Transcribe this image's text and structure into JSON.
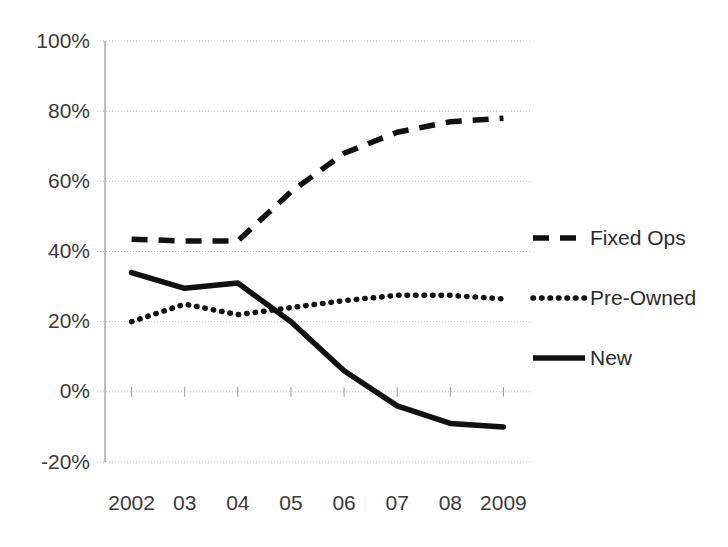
{
  "chart_data": {
    "type": "line",
    "title": "",
    "xlabel": "",
    "ylabel": "",
    "categories": [
      "2002",
      "03",
      "04",
      "05",
      "06",
      "07",
      "08",
      "2009"
    ],
    "ylim": [
      -20,
      100
    ],
    "ytick_labels": [
      "100%",
      "80%",
      "60%",
      "40%",
      "20%",
      "0%",
      "-20%"
    ],
    "ytick_values": [
      100,
      80,
      60,
      40,
      20,
      0,
      -20
    ],
    "grid": true,
    "legend_position": "right",
    "units": "percent",
    "series": [
      {
        "name": "Fixed Ops",
        "style": "dashed",
        "color": "#111111",
        "values": [
          43.5,
          43.0,
          43.0,
          57.0,
          68.0,
          74.0,
          77.0,
          78.0
        ]
      },
      {
        "name": "Pre-Owned",
        "style": "dotted",
        "color": "#111111",
        "values": [
          20.0,
          25.0,
          22.0,
          24.0,
          26.0,
          27.5,
          27.5,
          26.5
        ]
      },
      {
        "name": "New",
        "style": "solid",
        "color": "#111111",
        "values": [
          34.0,
          29.5,
          31.0,
          20.0,
          6.0,
          -4.0,
          -9.0,
          -10.0
        ]
      }
    ]
  },
  "axes": {
    "y_ticks": [
      {
        "label": "100%"
      },
      {
        "label": "80%"
      },
      {
        "label": "60%"
      },
      {
        "label": "40%"
      },
      {
        "label": "20%"
      },
      {
        "label": "0%"
      },
      {
        "label": "-20%"
      }
    ],
    "x_ticks": [
      {
        "label": "2002"
      },
      {
        "label": "03"
      },
      {
        "label": "04"
      },
      {
        "label": "05"
      },
      {
        "label": "06"
      },
      {
        "label": "07"
      },
      {
        "label": "08"
      },
      {
        "label": "2009"
      }
    ]
  },
  "legend": {
    "items": [
      {
        "label": "Fixed Ops",
        "style": "dashed"
      },
      {
        "label": "Pre-Owned",
        "style": "dotted"
      },
      {
        "label": "New",
        "style": "solid"
      }
    ]
  },
  "colors": {
    "series_stroke": "#111111",
    "gridline": "#b9b9b9",
    "axis": "#9a9a9a",
    "text": "#3a3a3a",
    "background": "#ffffff"
  }
}
